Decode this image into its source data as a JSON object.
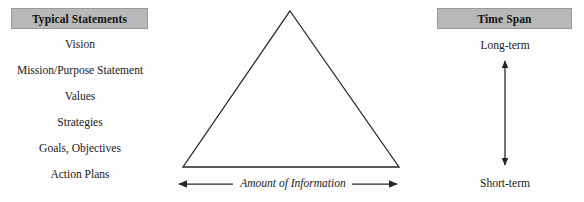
{
  "figure": {
    "type": "strategic-planning-triangle-diagram",
    "background_color": "#fdfdfd",
    "text_color": "#1a1a1a",
    "header_fill_color": "#b8b8b8",
    "header_border_color": "#9a9a9a",
    "line_color": "#262626"
  },
  "left_column": {
    "header": "Typical Statements",
    "items": [
      {
        "label": "Vision"
      },
      {
        "label": "Mission/Purpose Statement"
      },
      {
        "label": "Values"
      },
      {
        "label": "Strategies"
      },
      {
        "label": "Goals, Objectives"
      },
      {
        "label": "Action Plans"
      }
    ]
  },
  "center": {
    "triangle": {
      "apex": [
        290,
        11
      ],
      "bottom_left": [
        183,
        167
      ],
      "bottom_right": [
        399,
        167
      ],
      "fill": "none",
      "stroke_width": 1.3
    },
    "axis_caption": "Amount of Information",
    "axis_caption_style": "italic",
    "left_arrow": {
      "from": [
        233,
        184
      ],
      "to": [
        176,
        184
      ],
      "head": "left"
    },
    "right_arrow": {
      "from": [
        352,
        184
      ],
      "to": [
        400,
        184
      ],
      "head": "right"
    }
  },
  "right_column": {
    "header": "Time Span",
    "top_label": "Long-term",
    "bottom_label": "Short-term",
    "arrow": {
      "orientation": "vertical",
      "double_headed": true,
      "x": 505,
      "top_y": 57,
      "bottom_y": 169
    }
  }
}
